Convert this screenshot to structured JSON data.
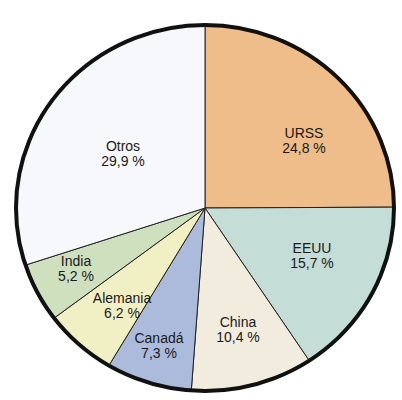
{
  "chart_data": {
    "type": "pie",
    "title": "",
    "start_angle_deg": 90,
    "direction": "clockwise",
    "slices": [
      {
        "label": "URSS",
        "value": 24.8,
        "value_text": "24,8 %",
        "color": "#efbd8a",
        "label_pos": [
          304,
          138
        ]
      },
      {
        "label": "EEUU",
        "value": 15.7,
        "value_text": "15,7 %",
        "color": "#c4ddd6",
        "label_pos": [
          312,
          253
        ]
      },
      {
        "label": "China",
        "value": 10.4,
        "value_text": "10,4 %",
        "color": "#f1ecdd",
        "label_pos": [
          238,
          327
        ]
      },
      {
        "label": "Canadá",
        "value": 7.3,
        "value_text": "7,3 %",
        "color": "#acbbdb",
        "label_pos": [
          159,
          343
        ]
      },
      {
        "label": "Alemania",
        "value": 6.2,
        "value_text": "6,2 %",
        "color": "#f0f0c4",
        "label_pos": [
          122,
          303
        ]
      },
      {
        "label": "India",
        "value": 5.2,
        "value_text": "5,2 %",
        "color": "#cfe0bf",
        "label_pos": [
          76,
          266
        ]
      },
      {
        "label": "Otros",
        "value": 29.9,
        "value_text": "29,9 %",
        "color": "#f7f8fb",
        "label_pos": [
          123,
          151
        ]
      }
    ],
    "center": [
      205,
      208
    ],
    "radius": [
      189,
      183
    ]
  }
}
